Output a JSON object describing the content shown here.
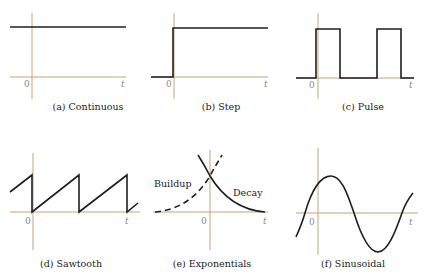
{
  "axis_labels": {
    "origin": "0",
    "time": "t"
  },
  "colors": {
    "axis": "#c9a37a",
    "signal": "#1e1e1e",
    "text": "#222222",
    "tick_text": "#8a8a8a"
  },
  "panels": [
    {
      "id": "a",
      "caption": "(a) Continuous",
      "signal": "constant"
    },
    {
      "id": "b",
      "caption": "(b) Step",
      "signal": "unit step at t=0"
    },
    {
      "id": "c",
      "caption": "(c) Pulse",
      "signal": "periodic rectangular pulses"
    },
    {
      "id": "d",
      "caption": "(d) Sawtooth",
      "signal": "periodic ramp with sharp drop"
    },
    {
      "id": "e",
      "caption": "(e) Exponentials",
      "signal": "exponential buildup (dashed) and decay (solid)",
      "annotations": {
        "buildup": "Buildup",
        "decay": "Decay"
      }
    },
    {
      "id": "f",
      "caption": "(f) Sinusoidal",
      "signal": "sine wave"
    }
  ]
}
